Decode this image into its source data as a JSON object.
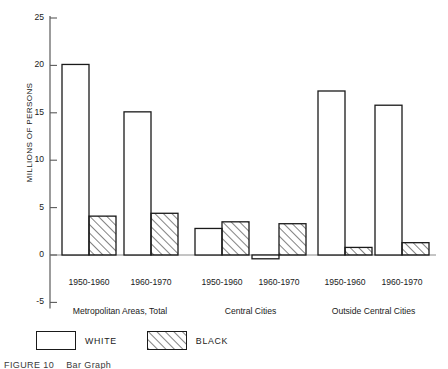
{
  "figure": {
    "caption_number": "FIGURE 10",
    "caption_text": "Bar Graph"
  },
  "legend": {
    "position": "bottom-left",
    "items": [
      {
        "label": "WHITE",
        "swatch": "open-rectangle-icon",
        "fill": "none"
      },
      {
        "label": "BLACK",
        "swatch": "hatched-rectangle-icon",
        "fill": "diagonal-hatch"
      }
    ]
  },
  "chart_data": {
    "type": "bar",
    "title": "",
    "subtitle": "",
    "xlabel": "",
    "ylabel": "MILLIONS OF PERSONS",
    "ylim": [
      -5,
      25
    ],
    "yticks": [
      -5,
      0,
      5,
      10,
      15,
      20,
      25
    ],
    "ytick_labels": [
      "-5",
      "0",
      "5",
      "10",
      "15",
      "20",
      "25"
    ],
    "grid": false,
    "legend_position": "bottom-left",
    "groups": [
      "Metropolitan Areas, Total",
      "Central Cities",
      "Outside Central Cities"
    ],
    "categories": [
      "1950-1960",
      "1960-1970",
      "1950-1960",
      "1960-1970",
      "1950-1960",
      "1960-1970"
    ],
    "group_of_category": [
      0,
      0,
      1,
      1,
      2,
      2
    ],
    "series": [
      {
        "name": "WHITE",
        "values": [
          20.1,
          15.1,
          2.8,
          -0.4,
          17.3,
          15.8
        ]
      },
      {
        "name": "BLACK",
        "values": [
          4.1,
          4.4,
          3.5,
          3.3,
          0.8,
          1.3
        ]
      }
    ],
    "annotations": []
  }
}
